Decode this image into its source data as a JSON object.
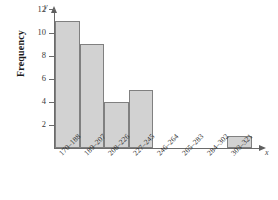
{
  "chart_data": {
    "type": "bar",
    "title": "",
    "xlabel": "",
    "ylabel": "Frequency",
    "x_axis_variable": "x",
    "y_axis_variable": "y",
    "categories": [
      "170–188",
      "189–207",
      "208–226",
      "227–245",
      "246–264",
      "265–283",
      "284–302",
      "303–321"
    ],
    "values": [
      11,
      9,
      4,
      5,
      0,
      0,
      0,
      1
    ],
    "ytick_labels": [
      "2",
      "4",
      "6",
      "8",
      "10",
      "12"
    ],
    "ytick_values": [
      2,
      4,
      6,
      8,
      10,
      12
    ],
    "ylim": [
      0,
      13
    ],
    "grid": false,
    "legend": null,
    "bar_fill_color": "#d2d2d2",
    "bar_border_color": "#808080",
    "axis_color": "#6b6b6b"
  }
}
